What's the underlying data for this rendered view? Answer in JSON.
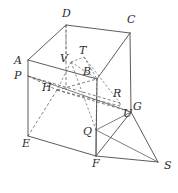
{
  "figure": {
    "background_color": "#ffffff",
    "line_color": "#4a4a4a",
    "dashed_line_color": "#5f5f5f",
    "label_color": "#2b2b2b",
    "canvas": {
      "width": 178,
      "height": 193
    }
  },
  "labels": [
    {
      "id": "D",
      "text": "D",
      "x": 62,
      "y": 8,
      "name": "vertex-label-d"
    },
    {
      "id": "C",
      "text": "C",
      "x": 127,
      "y": 14,
      "name": "vertex-label-c"
    },
    {
      "id": "T",
      "text": "T",
      "x": 79,
      "y": 45,
      "name": "vertex-label-t"
    },
    {
      "id": "A",
      "text": "A",
      "x": 14,
      "y": 55,
      "name": "vertex-label-a"
    },
    {
      "id": "V",
      "text": "V",
      "x": 60,
      "y": 53,
      "name": "vertex-label-v"
    },
    {
      "id": "B",
      "text": "B",
      "x": 83,
      "y": 66,
      "name": "vertex-label-b"
    },
    {
      "id": "P",
      "text": "P",
      "x": 14,
      "y": 70,
      "name": "vertex-label-p"
    },
    {
      "id": "H",
      "text": "H",
      "x": 42,
      "y": 82,
      "name": "vertex-label-h"
    },
    {
      "id": "R",
      "text": "R",
      "x": 113,
      "y": 88,
      "name": "vertex-label-r"
    },
    {
      "id": "G",
      "text": "G",
      "x": 133,
      "y": 101,
      "name": "vertex-label-g"
    },
    {
      "id": "U",
      "text": "U",
      "x": 123,
      "y": 108,
      "name": "vertex-label-u"
    },
    {
      "id": "E",
      "text": "E",
      "x": 22,
      "y": 138,
      "name": "vertex-label-e"
    },
    {
      "id": "Q",
      "text": "Q",
      "x": 83,
      "y": 126,
      "name": "vertex-label-q"
    },
    {
      "id": "F",
      "text": "F",
      "x": 92,
      "y": 158,
      "name": "vertex-label-f"
    },
    {
      "id": "S",
      "text": "S",
      "x": 164,
      "y": 160,
      "name": "vertex-label-s"
    }
  ],
  "points": {
    "D": [
      66,
      25
    ],
    "C": [
      130,
      33
    ],
    "A": [
      28,
      60
    ],
    "B": [
      97,
      79
    ],
    "E": [
      28,
      136
    ],
    "F": [
      96,
      156
    ],
    "G": [
      131,
      112
    ],
    "H": [
      57,
      90
    ],
    "P": [
      28,
      76
    ],
    "Q": [
      96,
      130
    ],
    "R": [
      120,
      103
    ],
    "T": [
      84,
      57
    ],
    "U": [
      120,
      106
    ],
    "V": [
      71,
      62
    ],
    "S": [
      158,
      162
    ]
  },
  "solid_edges": [
    {
      "name": "edge-a-d",
      "from": "A",
      "to": "D"
    },
    {
      "name": "edge-d-c",
      "from": "D",
      "to": "C"
    },
    {
      "name": "edge-c-g",
      "from": "C",
      "to": "G"
    },
    {
      "name": "edge-a-e",
      "from": "A",
      "to": "E"
    },
    {
      "name": "edge-e-f",
      "from": "E",
      "to": "F"
    },
    {
      "name": "edge-f-g",
      "from": "F",
      "to": "G"
    },
    {
      "name": "edge-b-c",
      "from": "B",
      "to": "C"
    },
    {
      "name": "edge-b-f",
      "from": "B",
      "to": "F"
    },
    {
      "name": "edge-a-b",
      "from": "A",
      "to": "B"
    },
    {
      "name": "edge-p-g",
      "from": "P",
      "to": "G"
    },
    {
      "name": "edge-f-s",
      "from": "F",
      "to": "S"
    },
    {
      "name": "edge-g-s",
      "from": "G",
      "to": "S"
    },
    {
      "name": "edge-q-s",
      "from": "Q",
      "to": "S"
    },
    {
      "name": "edge-q-g",
      "from": "Q",
      "to": "G"
    },
    {
      "name": "edge-q-f",
      "from": "Q",
      "to": "F"
    }
  ],
  "dashed_edges": [
    {
      "name": "edge-d-h-hidden",
      "from": "D",
      "to": "H"
    },
    {
      "name": "edge-h-e-hidden",
      "from": "H",
      "to": "E"
    },
    {
      "name": "edge-h-g-hidden",
      "from": "H",
      "to": "G"
    },
    {
      "name": "edge-p-h-hidden",
      "from": "P",
      "to": "H"
    },
    {
      "name": "edge-h-b-hidden",
      "from": "H",
      "to": "B"
    },
    {
      "name": "edge-p-r-hidden",
      "from": "P",
      "to": "R"
    },
    {
      "name": "edge-v-t-hidden",
      "from": "V",
      "to": "T"
    },
    {
      "name": "edge-t-b-hidden",
      "from": "T",
      "to": "B"
    },
    {
      "name": "edge-v-b-hidden",
      "from": "V",
      "to": "B"
    },
    {
      "name": "edge-v-q-hidden",
      "from": "V",
      "to": "Q"
    },
    {
      "name": "edge-t-r-hidden",
      "from": "T",
      "to": "R"
    },
    {
      "name": "edge-b-q-hidden",
      "from": "B",
      "to": "Q"
    },
    {
      "name": "edge-r-u-hidden",
      "from": "R",
      "to": "U"
    },
    {
      "name": "edge-v-h-hidden",
      "from": "V",
      "to": "H"
    }
  ]
}
